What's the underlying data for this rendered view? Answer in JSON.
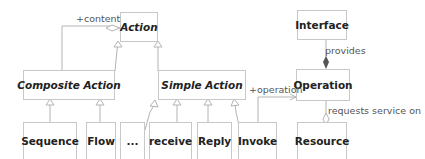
{
  "diagram": {
    "classes": {
      "action": "Action",
      "composite_action": "Composite Action",
      "simple_action": "Simple Action",
      "sequence": "Sequence",
      "flow": "Flow",
      "ellipsis": "...",
      "receive": "receive",
      "reply": "Reply",
      "invoke": "Invoke",
      "interface": "Interface",
      "operation": "Operation",
      "resource": "Resource"
    },
    "labels": {
      "content": "+content",
      "provides": "provides",
      "operation_role": "+operation",
      "requests_service_on": "requests service on"
    },
    "colors": {
      "line": "#b4b4b4",
      "border": "#c8c8c8",
      "text": "#222222",
      "diamond": "#555555"
    }
  }
}
